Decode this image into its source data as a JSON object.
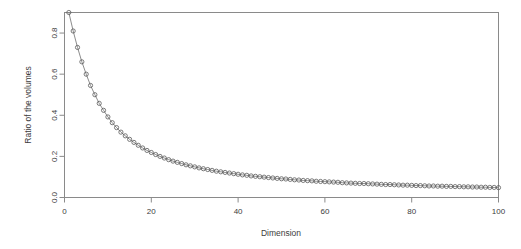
{
  "chart_data": {
    "type": "line",
    "title": "",
    "subtitle": "",
    "xlabel": "Dimension",
    "ylabel": "Ratio of the volumes",
    "grid": false,
    "legend": null,
    "marker": "open-circle",
    "line_style": "solid-thin",
    "xlim": [
      1,
      100
    ],
    "ylim": [
      0.0,
      0.9
    ],
    "xticks": [
      0,
      20,
      40,
      60,
      80,
      100
    ],
    "xticklabels": [
      "0",
      "20",
      "40",
      "60",
      "80",
      "100"
    ],
    "yticks": [
      0.0,
      0.2,
      0.4,
      0.6,
      0.8
    ],
    "yticklabels": [
      "0.0",
      "0.2",
      "0.4",
      "0.6",
      "0.8"
    ],
    "x": [
      1,
      2,
      3,
      4,
      5,
      6,
      7,
      8,
      9,
      10,
      11,
      12,
      13,
      14,
      15,
      16,
      17,
      18,
      19,
      20,
      21,
      22,
      23,
      24,
      25,
      26,
      27,
      28,
      29,
      30,
      31,
      32,
      33,
      34,
      35,
      36,
      37,
      38,
      39,
      40,
      41,
      42,
      43,
      44,
      45,
      46,
      47,
      48,
      49,
      50,
      51,
      52,
      53,
      54,
      55,
      56,
      57,
      58,
      59,
      60,
      61,
      62,
      63,
      64,
      65,
      66,
      67,
      68,
      69,
      70,
      71,
      72,
      73,
      74,
      75,
      76,
      77,
      78,
      79,
      80,
      81,
      82,
      83,
      84,
      85,
      86,
      87,
      88,
      89,
      90,
      91,
      92,
      93,
      94,
      95,
      96,
      97,
      98,
      99,
      100
    ],
    "values": [
      0.9,
      0.81,
      0.73,
      0.66,
      0.6,
      0.545,
      0.5,
      0.458,
      0.424,
      0.392,
      0.364,
      0.34,
      0.318,
      0.3,
      0.283,
      0.268,
      0.254,
      0.241,
      0.229,
      0.219,
      0.209,
      0.2,
      0.192,
      0.184,
      0.177,
      0.171,
      0.165,
      0.159,
      0.154,
      0.149,
      0.144,
      0.14,
      0.136,
      0.132,
      0.128,
      0.125,
      0.122,
      0.119,
      0.116,
      0.113,
      0.11,
      0.108,
      0.105,
      0.103,
      0.101,
      0.099,
      0.097,
      0.095,
      0.093,
      0.091,
      0.09,
      0.088,
      0.086,
      0.085,
      0.083,
      0.082,
      0.081,
      0.079,
      0.078,
      0.077,
      0.076,
      0.075,
      0.074,
      0.072,
      0.071,
      0.07,
      0.069,
      0.068,
      0.068,
      0.067,
      0.066,
      0.065,
      0.064,
      0.063,
      0.063,
      0.062,
      0.061,
      0.06,
      0.06,
      0.059,
      0.058,
      0.058,
      0.057,
      0.056,
      0.056,
      0.055,
      0.055,
      0.054,
      0.054,
      0.053,
      0.053,
      0.052,
      0.052,
      0.051,
      0.051,
      0.05,
      0.05,
      0.049,
      0.049,
      0.048
    ]
  },
  "colors": {
    "frame": "#8a8a8a",
    "marker": "#5a5a5a",
    "line": "#6e6e6e",
    "text": "#3c3c3c",
    "background": "#ffffff"
  }
}
